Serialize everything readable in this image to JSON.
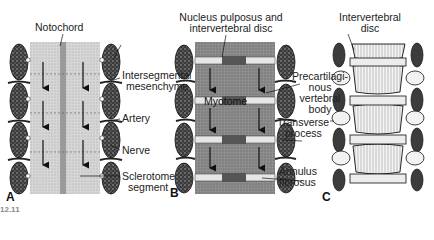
{
  "figure": {
    "panels": [
      {
        "id": "A",
        "letter": "A",
        "labels": {
          "notochord": "Notochord",
          "intersegmental_1": "Intersegmental",
          "intersegmental_2": "mesenchyme",
          "artery": "Artery",
          "nerve": "Nerve",
          "sclerotome_1": "Sclerotome",
          "sclerotome_2": "segment"
        }
      },
      {
        "id": "B",
        "letter": "B",
        "labels": {
          "nucleus_1": "Nucleus pulposus and",
          "nucleus_2": "intervertebral disc",
          "precart_1": "Precartilagi-",
          "precart_2": "nous",
          "precart_3": "vertebral",
          "precart_4": "body",
          "myotome": "Myotome",
          "transverse_1": "Transverse",
          "transverse_2": "process",
          "annulus_1": "Annulus",
          "annulus_2": "fibrosus"
        }
      },
      {
        "id": "C",
        "letter": "C",
        "labels": {
          "ivd_1": "Intervertebral",
          "ivd_2": "disc"
        }
      }
    ],
    "caption_fragment": "12.11"
  }
}
